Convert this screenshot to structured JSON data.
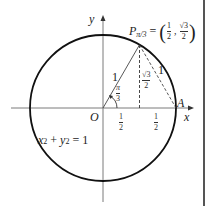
{
  "diagram": {
    "type": "unit-circle",
    "equation": "x² + y² = 1",
    "equation_parts": {
      "x": "x",
      "x_exp": "2",
      "plus": "+",
      "y": "y",
      "y_exp": "2",
      "rhs": "= 1"
    },
    "axes": {
      "x_label": "x",
      "y_label": "y"
    },
    "origin_label": "O",
    "point_a_label": "A",
    "point_p": {
      "label": "P",
      "subscript": "π/3",
      "equals": "=",
      "coord_x": {
        "num": "1",
        "den": "2"
      },
      "coord_y": {
        "num": "√3",
        "den": "2"
      }
    },
    "angle": {
      "num": "π",
      "den": "3"
    },
    "radius_label": "1",
    "chord_label": "1",
    "height_label": {
      "num": "√3",
      "den": "2"
    },
    "base_segments": [
      {
        "num": "1",
        "den": "2"
      },
      {
        "num": "1",
        "den": "2"
      }
    ],
    "colors": {
      "circle": "#111111",
      "axis": "#777777",
      "line": "#333333"
    }
  }
}
